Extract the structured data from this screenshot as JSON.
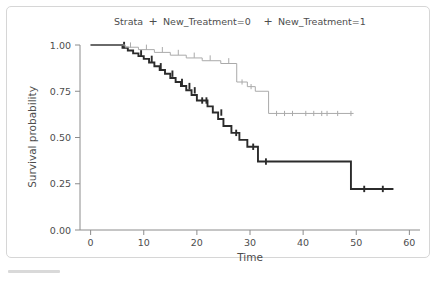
{
  "chart_data": {
    "type": "line",
    "subtype": "kaplan-meier-step",
    "title": "",
    "xlabel": "Time",
    "ylabel": "Survival probability",
    "xlim": [
      -2,
      62
    ],
    "ylim": [
      0.0,
      1.0
    ],
    "xticks": [
      0,
      10,
      20,
      30,
      40,
      50,
      60
    ],
    "xticklabels": [
      "0",
      "10",
      "20",
      "30",
      "40",
      "50",
      "60"
    ],
    "yticks": [
      0.0,
      0.25,
      0.5,
      0.75,
      1.0
    ],
    "yticklabels": [
      "0.00",
      "0.25",
      "0.50",
      "0.75",
      "1.00"
    ],
    "grid": false,
    "legend": {
      "title": "Strata",
      "position": "top",
      "marker": "+",
      "entries": [
        {
          "label": "New_Treatment=0",
          "color": "#2b2b2b"
        },
        {
          "label": "New_Treatment=1",
          "color": "#aaaaaa"
        }
      ]
    },
    "series": [
      {
        "name": "New_Treatment=0",
        "color": "#2b2b2b",
        "width": 1.9,
        "steps": [
          [
            0.0,
            1.0
          ],
          [
            6.0,
            1.0
          ],
          [
            6.0,
            0.985
          ],
          [
            7.0,
            0.985
          ],
          [
            7.0,
            0.97
          ],
          [
            8.0,
            0.97
          ],
          [
            8.0,
            0.955
          ],
          [
            9.0,
            0.955
          ],
          [
            9.0,
            0.94
          ],
          [
            10.0,
            0.94
          ],
          [
            10.0,
            0.925
          ],
          [
            11.0,
            0.925
          ],
          [
            11.0,
            0.905
          ],
          [
            12.0,
            0.905
          ],
          [
            12.0,
            0.885
          ],
          [
            13.0,
            0.885
          ],
          [
            13.0,
            0.865
          ],
          [
            14.0,
            0.865
          ],
          [
            14.0,
            0.845
          ],
          [
            15.0,
            0.845
          ],
          [
            15.0,
            0.822
          ],
          [
            16.0,
            0.822
          ],
          [
            16.0,
            0.8
          ],
          [
            17.0,
            0.8
          ],
          [
            17.0,
            0.778
          ],
          [
            18.0,
            0.778
          ],
          [
            18.0,
            0.755
          ],
          [
            19.0,
            0.755
          ],
          [
            19.0,
            0.73
          ],
          [
            20.0,
            0.73
          ],
          [
            20.0,
            0.7
          ],
          [
            22.0,
            0.7
          ],
          [
            22.0,
            0.668
          ],
          [
            23.0,
            0.668
          ],
          [
            23.0,
            0.635
          ],
          [
            24.0,
            0.635
          ],
          [
            24.0,
            0.6
          ],
          [
            25.0,
            0.6
          ],
          [
            25.0,
            0.562
          ],
          [
            26.5,
            0.562
          ],
          [
            26.5,
            0.525
          ],
          [
            28.0,
            0.525
          ],
          [
            28.0,
            0.487
          ],
          [
            29.5,
            0.487
          ],
          [
            29.5,
            0.45
          ],
          [
            31.5,
            0.45
          ],
          [
            31.5,
            0.37
          ],
          [
            49.0,
            0.37
          ],
          [
            49.0,
            0.222
          ],
          [
            57.0,
            0.222
          ]
        ],
        "censored": [
          [
            6.3,
            1.0
          ],
          [
            9.5,
            0.955
          ],
          [
            11.5,
            0.925
          ],
          [
            13.2,
            0.885
          ],
          [
            15.4,
            0.845
          ],
          [
            17.2,
            0.8
          ],
          [
            18.6,
            0.778
          ],
          [
            19.6,
            0.755
          ],
          [
            21.0,
            0.7
          ],
          [
            21.8,
            0.7
          ],
          [
            24.6,
            0.635
          ],
          [
            27.4,
            0.525
          ],
          [
            30.6,
            0.45
          ],
          [
            33.0,
            0.37
          ],
          [
            51.5,
            0.222
          ],
          [
            55.0,
            0.222
          ]
        ]
      },
      {
        "name": "New_Treatment=1",
        "color": "#aaaaaa",
        "width": 1.0,
        "steps": [
          [
            0.0,
            1.0
          ],
          [
            6.5,
            1.0
          ],
          [
            6.5,
            0.988
          ],
          [
            9.0,
            0.988
          ],
          [
            9.0,
            0.975
          ],
          [
            12.0,
            0.975
          ],
          [
            12.0,
            0.96
          ],
          [
            15.0,
            0.96
          ],
          [
            15.0,
            0.945
          ],
          [
            18.0,
            0.945
          ],
          [
            18.0,
            0.93
          ],
          [
            21.0,
            0.93
          ],
          [
            21.0,
            0.915
          ],
          [
            24.5,
            0.915
          ],
          [
            24.5,
            0.9
          ],
          [
            27.5,
            0.9
          ],
          [
            27.5,
            0.8
          ],
          [
            29.5,
            0.8
          ],
          [
            29.5,
            0.775
          ],
          [
            31.0,
            0.775
          ],
          [
            31.0,
            0.75
          ],
          [
            33.5,
            0.75
          ],
          [
            33.5,
            0.63
          ],
          [
            49.5,
            0.63
          ]
        ],
        "censored": [
          [
            7.5,
            1.0
          ],
          [
            10.5,
            0.988
          ],
          [
            13.5,
            0.975
          ],
          [
            16.5,
            0.96
          ],
          [
            19.5,
            0.945
          ],
          [
            22.5,
            0.93
          ],
          [
            26.0,
            0.915
          ],
          [
            28.5,
            0.8
          ],
          [
            30.2,
            0.775
          ],
          [
            35.0,
            0.63
          ],
          [
            36.5,
            0.63
          ],
          [
            38.0,
            0.63
          ],
          [
            40.5,
            0.63
          ],
          [
            42.0,
            0.63
          ],
          [
            43.5,
            0.63
          ],
          [
            44.5,
            0.63
          ],
          [
            46.5,
            0.63
          ],
          [
            49.0,
            0.63
          ]
        ]
      }
    ]
  }
}
